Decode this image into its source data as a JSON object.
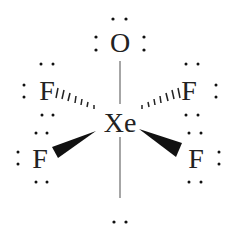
{
  "diagram": {
    "central_atom": {
      "symbol": "Xe",
      "x": 120,
      "y": 130
    },
    "atoms": [
      {
        "id": "O",
        "symbol": "O",
        "x": 120,
        "y": 52,
        "bond": "single-line"
      },
      {
        "id": "F-upper-left",
        "symbol": "F",
        "x": 47,
        "y": 99,
        "bond": "hashed-wedge"
      },
      {
        "id": "F-upper-right",
        "symbol": "F",
        "x": 190,
        "y": 99,
        "bond": "hashed-wedge"
      },
      {
        "id": "F-lower-left",
        "symbol": "F",
        "x": 40,
        "y": 167,
        "bond": "solid-wedge"
      },
      {
        "id": "F-lower-right",
        "symbol": "F",
        "x": 196,
        "y": 167,
        "bond": "solid-wedge"
      }
    ],
    "lone_pair_on_xe": "bottom",
    "colors": {
      "text": "#222222",
      "bond": "#111111",
      "line": "#888888"
    }
  }
}
